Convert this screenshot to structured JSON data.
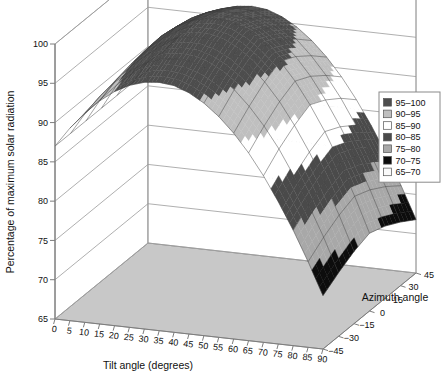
{
  "chart_data": {
    "type": "surface",
    "title": "",
    "xlabel": "Tilt angle (degrees)",
    "ylabel": "Azimuth angle",
    "zlabel": "Percentage of maximum solar radiation",
    "x": [
      0,
      5,
      10,
      15,
      20,
      25,
      30,
      35,
      40,
      45,
      50,
      55,
      60,
      65,
      70,
      75,
      80,
      85,
      90
    ],
    "y": [
      -45,
      -30,
      -15,
      0,
      15,
      30,
      45
    ],
    "xlim": [
      0,
      90
    ],
    "ylim": [
      -45,
      45
    ],
    "zlim": [
      65,
      100
    ],
    "xticks": [
      "0",
      "5",
      "10",
      "15",
      "20",
      "25",
      "30",
      "35",
      "40",
      "45",
      "50",
      "55",
      "60",
      "65",
      "70",
      "75",
      "80",
      "85",
      "90"
    ],
    "yticks": [
      "-45",
      "-30",
      "-15",
      "0",
      "15",
      "30",
      "45"
    ],
    "zticks": [
      "65",
      "70",
      "75",
      "80",
      "85",
      "90",
      "95",
      "100"
    ],
    "grid": true,
    "legend_position": "right",
    "legend_title": "",
    "legend": [
      {
        "label": "95-100",
        "color": "#4d4d4d",
        "min": 95,
        "max": 100
      },
      {
        "label": "90-95",
        "color": "#bfbfbf",
        "min": 90,
        "max": 95
      },
      {
        "label": "85-90",
        "color": "#ffffff",
        "min": 85,
        "max": 90
      },
      {
        "label": "80-85",
        "color": "#4a4a4a",
        "min": 80,
        "max": 85
      },
      {
        "label": "75-80",
        "color": "#a8a8a8",
        "min": 75,
        "max": 80
      },
      {
        "label": "70-75",
        "color": "#0d0d0d",
        "min": 70,
        "max": 75
      },
      {
        "label": "65-70",
        "color": "#fafafa",
        "min": 65,
        "max": 70
      }
    ],
    "floor_color": "#c8c8c8",
    "mesh_color": "#3a3a3a",
    "frame_color": "#9a9a9a",
    "series": [
      {
        "name": "az=-45",
        "values": [
          87.0,
          89.5,
          91.6,
          93.4,
          94.8,
          95.8,
          96.4,
          96.6,
          96.4,
          95.7,
          94.6,
          93.1,
          91.2,
          88.9,
          86.2,
          83.1,
          79.7,
          75.9,
          71.8
        ]
      },
      {
        "name": "az=-30",
        "values": [
          87.0,
          89.8,
          92.2,
          94.2,
          95.8,
          97.0,
          97.7,
          98.0,
          97.9,
          97.3,
          96.3,
          94.9,
          93.0,
          90.7,
          88.0,
          84.8,
          81.3,
          77.4,
          73.1
        ]
      },
      {
        "name": "az=-15",
        "values": [
          87.0,
          90.0,
          92.6,
          94.8,
          96.6,
          97.9,
          98.8,
          99.2,
          99.2,
          98.7,
          97.7,
          96.3,
          94.5,
          92.2,
          89.4,
          86.2,
          82.6,
          78.6,
          74.2
        ]
      },
      {
        "name": "az=0",
        "values": [
          87.0,
          90.1,
          92.8,
          95.1,
          97.0,
          98.4,
          99.4,
          99.9,
          100.0,
          99.6,
          98.7,
          97.3,
          95.5,
          93.2,
          90.4,
          87.2,
          83.5,
          79.4,
          74.9
        ]
      },
      {
        "name": "az=15",
        "values": [
          87.0,
          90.0,
          92.6,
          94.8,
          96.6,
          97.9,
          98.8,
          99.2,
          99.2,
          98.7,
          97.7,
          96.3,
          94.5,
          92.2,
          89.4,
          86.2,
          82.6,
          78.6,
          74.2
        ]
      },
      {
        "name": "az=30",
        "values": [
          87.0,
          89.8,
          92.2,
          94.2,
          95.8,
          97.0,
          97.7,
          98.0,
          97.9,
          97.3,
          96.3,
          94.9,
          93.0,
          90.7,
          88.0,
          84.8,
          81.3,
          77.4,
          73.1
        ]
      },
      {
        "name": "az=45",
        "values": [
          87.0,
          89.5,
          91.6,
          93.4,
          94.8,
          95.8,
          96.4,
          96.6,
          96.4,
          95.7,
          94.6,
          93.1,
          91.2,
          88.9,
          86.2,
          83.1,
          79.7,
          75.9,
          71.8
        ]
      }
    ]
  }
}
